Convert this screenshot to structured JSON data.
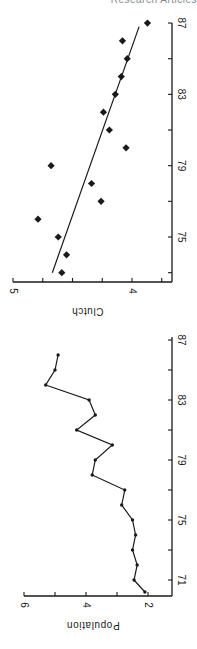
{
  "header": {
    "text": "Research Articles"
  },
  "chart_data": [
    {
      "type": "scatter",
      "title": "",
      "xlabel": "",
      "ylabel": "Clutch",
      "xlim": [
        72.5,
        87
      ],
      "ylim": [
        3.75,
        5
      ],
      "x_ticks": [
        75,
        79,
        83,
        87
      ],
      "y_ticks": [
        5,
        4
      ],
      "y_minor_ticks": [
        4.75,
        4.5,
        4.25,
        3.75
      ],
      "rotation": "figure rotated 90 degrees clockwise on page",
      "series": [
        {
          "name": "Clutch size",
          "marker": "diamond",
          "x": [
            73,
            74,
            75,
            76,
            77,
            78,
            79,
            80,
            81,
            82,
            83,
            84,
            85,
            86,
            87
          ],
          "y": [
            4.59,
            4.55,
            4.62,
            4.79,
            4.26,
            4.34,
            4.68,
            4.05,
            4.19,
            4.24,
            4.14,
            4.09,
            4.04,
            4.08,
            3.87
          ]
        },
        {
          "name": "Regression line",
          "type": "line",
          "x": [
            73,
            86.8
          ],
          "y": [
            4.67,
            3.94
          ]
        }
      ]
    },
    {
      "type": "line",
      "title": "",
      "xlabel": "",
      "ylabel": "Population",
      "xlim": [
        69.5,
        87
      ],
      "ylim": [
        1.5,
        6
      ],
      "x_ticks": [
        71,
        75,
        79,
        83,
        87
      ],
      "y_ticks": [
        6,
        4,
        2
      ],
      "y_minor_ticks": [
        5,
        3
      ],
      "series": [
        {
          "name": "Population",
          "marker": "dot",
          "x": [
            70.2,
            71,
            72,
            73,
            74,
            75,
            76,
            77,
            78,
            79,
            80,
            81,
            82,
            83,
            84,
            85,
            86
          ],
          "y": [
            2.1,
            2.45,
            2.35,
            2.5,
            2.4,
            2.5,
            2.85,
            2.75,
            3.8,
            3.7,
            3.15,
            4.3,
            3.7,
            3.9,
            5.3,
            5.0,
            4.9
          ]
        }
      ]
    }
  ],
  "labels": {
    "clutch_axis": "Clutch",
    "population_axis": "Population",
    "clutch_y_ticks": [
      "5",
      "4"
    ],
    "clutch_x_ticks": [
      "75",
      "79",
      "83",
      "87"
    ],
    "population_y_ticks": [
      "6",
      "4",
      "2"
    ],
    "population_x_ticks": [
      "71",
      "75",
      "79",
      "83",
      "87"
    ]
  }
}
